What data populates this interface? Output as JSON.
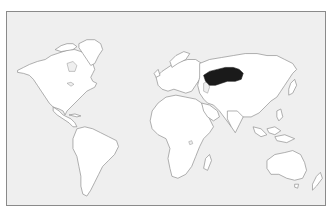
{
  "map": {
    "type": "world-locator-map",
    "projection": "equirectangular-like",
    "highlighted_region": {
      "name": "Kazakhstan",
      "fill_color": "#1a1a1a"
    },
    "colors": {
      "ocean": "#efefef",
      "land": "#ffffff",
      "coastline": "#8e8e8e",
      "frame_border": "#8a8a8a",
      "highlight": "#1a1a1a"
    },
    "continents": [
      "North America",
      "Greenland",
      "South America",
      "Europe",
      "Africa",
      "Asia",
      "Australia",
      "New Zealand"
    ]
  }
}
